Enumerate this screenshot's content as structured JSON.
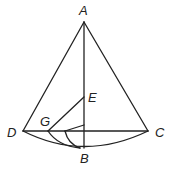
{
  "diagram": {
    "points": {
      "A": {
        "label": "A",
        "x": 84,
        "y": 22
      },
      "B": {
        "label": "B",
        "x": 84,
        "y": 148
      },
      "C": {
        "label": "C",
        "x": 148,
        "y": 131
      },
      "D": {
        "label": "D",
        "x": 23,
        "y": 131
      },
      "E": {
        "label": "E",
        "x": 84,
        "y": 97
      },
      "G": {
        "label": "G",
        "x": 48,
        "y": 131
      }
    },
    "stroke_color": "#222222"
  }
}
